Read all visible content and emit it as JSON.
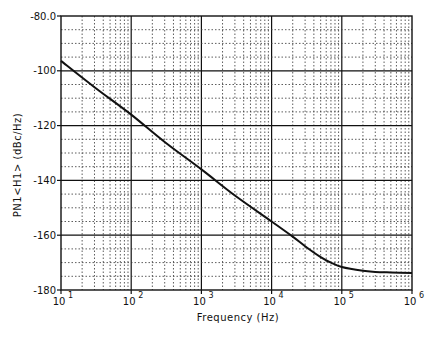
{
  "chart_data": {
    "type": "line",
    "title": "",
    "xlabel": "Frequency  (Hz)",
    "ylabel": "PN1<H1>  (dBc/Hz)",
    "xscale": "log",
    "xlim": [
      10,
      1000000
    ],
    "ylim": [
      -180,
      -80
    ],
    "x_ticks": [
      {
        "base": "10",
        "exp": "1",
        "value": 10
      },
      {
        "base": "10",
        "exp": "2",
        "value": 100
      },
      {
        "base": "10",
        "exp": "3",
        "value": 1000
      },
      {
        "base": "10",
        "exp": "4",
        "value": 10000
      },
      {
        "base": "10",
        "exp": "5",
        "value": 100000
      },
      {
        "base": "10",
        "exp": "6",
        "value": 1000000
      }
    ],
    "y_ticks": [
      "-80.0",
      "-100",
      "-120",
      "-140",
      "-160",
      "-180"
    ],
    "y_tick_values": [
      -80,
      -100,
      -120,
      -140,
      -160,
      -180
    ],
    "grid": {
      "major": "solid",
      "minor": "dotted",
      "y_minor_step": 5
    },
    "legend": null,
    "series": [
      {
        "name": "PN1<H1>",
        "x": [
          10,
          30,
          100,
          300,
          1000,
          3000,
          10000,
          20000,
          30000,
          50000,
          70000,
          100000,
          200000,
          300000,
          500000,
          1000000
        ],
        "y": [
          -96.4,
          -106,
          -116,
          -126,
          -136,
          -145.5,
          -155,
          -160.5,
          -164,
          -168,
          -170,
          -171.6,
          -173,
          -173.4,
          -173.6,
          -173.8
        ]
      }
    ]
  }
}
